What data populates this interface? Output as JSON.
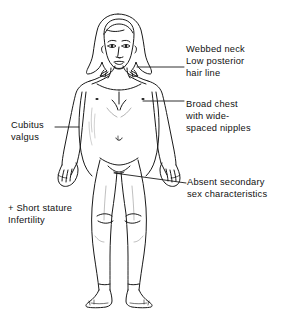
{
  "figure": {
    "ink_color": "#1a1a1a",
    "background_color": "#ffffff"
  },
  "annotations": [
    {
      "id": "webbed-neck",
      "side": "right",
      "lines": [
        "Webbed neck",
        "Low posterior",
        "hair line"
      ],
      "leader": {
        "x1": 137,
        "y1": 67,
        "x2": 184,
        "y2": 67
      }
    },
    {
      "id": "broad-chest",
      "side": "right",
      "lines": [
        "Broad chest",
        "with wide-",
        "spaced nipples"
      ],
      "leader": {
        "x1": 143,
        "y1": 101,
        "x2": 184,
        "y2": 101
      }
    },
    {
      "id": "absent-secondary-sex-characteristics",
      "side": "right",
      "lines": [
        "Absent secondary",
        "sex characteristics"
      ],
      "leader": {
        "x1": 114,
        "y1": 173,
        "x2": 186,
        "y2": 183
      }
    },
    {
      "id": "cubitus-valgus",
      "side": "left",
      "lines": [
        "Cubitus",
        "valgus"
      ],
      "leader": {
        "x1": 55,
        "y1": 127,
        "x2": 79,
        "y2": 127
      }
    },
    {
      "id": "short-stature-infertility",
      "side": "left",
      "lines": [
        "+ Short stature",
        "Infertility"
      ],
      "leader": null
    }
  ]
}
